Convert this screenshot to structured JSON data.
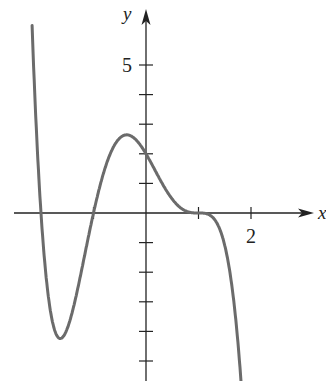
{
  "chart_data": {
    "type": "line",
    "title": "",
    "xlabel": "x",
    "ylabel": "y",
    "x_tick_labels": [
      {
        "value": 2,
        "label": "2"
      }
    ],
    "y_tick_labels": [
      {
        "value": 5,
        "label": "5"
      }
    ],
    "x_ticks": [
      -2,
      -1,
      1,
      2
    ],
    "y_ticks": [
      -5,
      -4,
      -3,
      -2,
      -1,
      1,
      2,
      3,
      4,
      5
    ],
    "xlim": [
      -2.5,
      3.2
    ],
    "ylim": [
      -5.7,
      6.2
    ],
    "grid": false,
    "legend": null,
    "curve_color": "#6b6b6b",
    "axis_color": "#222222",
    "function_hint": "y = -(x-1)^3 (x+1)(x+2)",
    "key_points": [
      {
        "x": -2,
        "y": 0,
        "note": "root"
      },
      {
        "x": -1.67,
        "y": -4.2,
        "note": "local minimum"
      },
      {
        "x": -1,
        "y": 0,
        "note": "root"
      },
      {
        "x": -0.38,
        "y": 2.7,
        "note": "local maximum"
      },
      {
        "x": 0,
        "y": 2,
        "note": "y-intercept"
      },
      {
        "x": 1,
        "y": 0,
        "note": "root (inflection, flat)"
      }
    ],
    "series": [
      {
        "name": "f(x)",
        "x": [
          -2.2,
          -2.1,
          -2.0,
          -1.9,
          -1.8,
          -1.67,
          -1.5,
          -1.4,
          -1.2,
          -1.0,
          -0.8,
          -0.6,
          -0.38,
          -0.2,
          0,
          0.2,
          0.4,
          0.6,
          0.8,
          1.0,
          1.2,
          1.4,
          1.6,
          1.8
        ],
        "y": [
          6.4,
          2.9,
          0,
          -2.2,
          -3.6,
          -4.2,
          -3.9,
          -3.4,
          -1.9,
          0,
          1.6,
          2.5,
          2.7,
          2.4,
          2.0,
          1.3,
          0.64,
          0.2,
          0.02,
          0,
          -0.03,
          -0.35,
          -1.55,
          -4.3
        ]
      }
    ]
  }
}
